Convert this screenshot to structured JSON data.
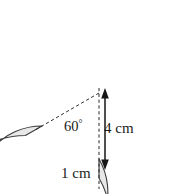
{
  "figure": {
    "kind": "geometry-diagram",
    "colors": {
      "ring_fill": "#e8e8e8",
      "ring_stroke": "#3c3c3c",
      "guide_line": "#2b2b2b",
      "background": "#ffffff",
      "text": "#1b1b1b"
    },
    "geometry": {
      "center_x": 99,
      "center_y": 93,
      "outer_radius_px": 85,
      "inner_radius_px": 66,
      "gap_start_deg": 270,
      "gap_sweep_deg": 60
    },
    "labels": {
      "angle": "60",
      "angle_degree_symbol": "°",
      "inner_radius": "4 cm",
      "band_thickness": "1 cm"
    },
    "annotations": {
      "radius_arrow": "double-headed-vertical-arrow",
      "dashed_radius_line": "dashed-radius-to-gap-edge",
      "dashed_vertical_line": "dashed-vertical-center-line"
    }
  }
}
